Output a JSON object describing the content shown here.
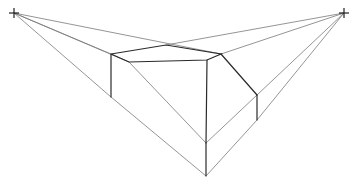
{
  "drawing": {
    "title": "Two-point perspective sketch of a box",
    "vanishing_points": {
      "left": {
        "x": 14,
        "y": 13
      },
      "right": {
        "x": 344,
        "y": 13
      }
    },
    "colors": {
      "background": "#ffffff",
      "edge": "#2a2a2a",
      "guide": "#7a7a7a"
    }
  }
}
